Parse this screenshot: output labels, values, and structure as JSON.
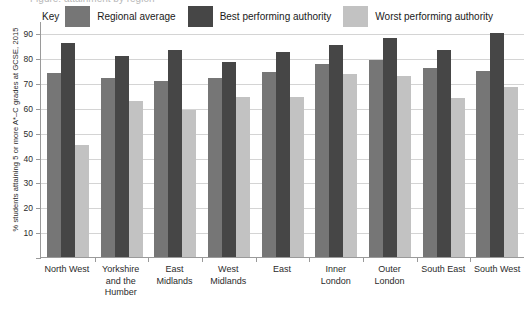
{
  "clipped_header": "Figure: attainment by region",
  "legend": {
    "key_label": "Key",
    "items": [
      {
        "label": "Regional average",
        "color": "#767676"
      },
      {
        "label": "Best performing authority",
        "color": "#464646"
      },
      {
        "label": "Worst performing authority",
        "color": "#c2c2c2"
      }
    ]
  },
  "chart_data": {
    "type": "bar",
    "title": "",
    "xlabel": "",
    "ylabel": "% students attaining 5 or more A*–C grades at GCSE, 2015",
    "ylim": [
      0,
      95
    ],
    "yticks": [
      0,
      10,
      20,
      30,
      40,
      50,
      60,
      70,
      80,
      90
    ],
    "ytick_labels": [
      "",
      "10",
      "20",
      "30",
      "40",
      "50",
      "60",
      "70",
      "80",
      "90"
    ],
    "grid": true,
    "legend_position": "top",
    "categories": [
      "North West",
      "Yorkshire and the Humber",
      "East Midlands",
      "West Midlands",
      "East",
      "Inner London",
      "Outer London",
      "South East",
      "South West"
    ],
    "series": [
      {
        "name": "Regional average",
        "color": "#767676",
        "values": [
          74,
          72,
          71,
          72,
          74.5,
          77.5,
          79.5,
          76,
          75
        ]
      },
      {
        "name": "Best performing authority",
        "color": "#464646",
        "values": [
          86,
          81,
          83.5,
          78.5,
          82.5,
          85.5,
          88,
          83.5,
          90
        ]
      },
      {
        "name": "Worst performing authority",
        "color": "#c2c2c2",
        "values": [
          45,
          63,
          59,
          64.5,
          64.5,
          73.5,
          73,
          64,
          68.5
        ]
      }
    ]
  }
}
